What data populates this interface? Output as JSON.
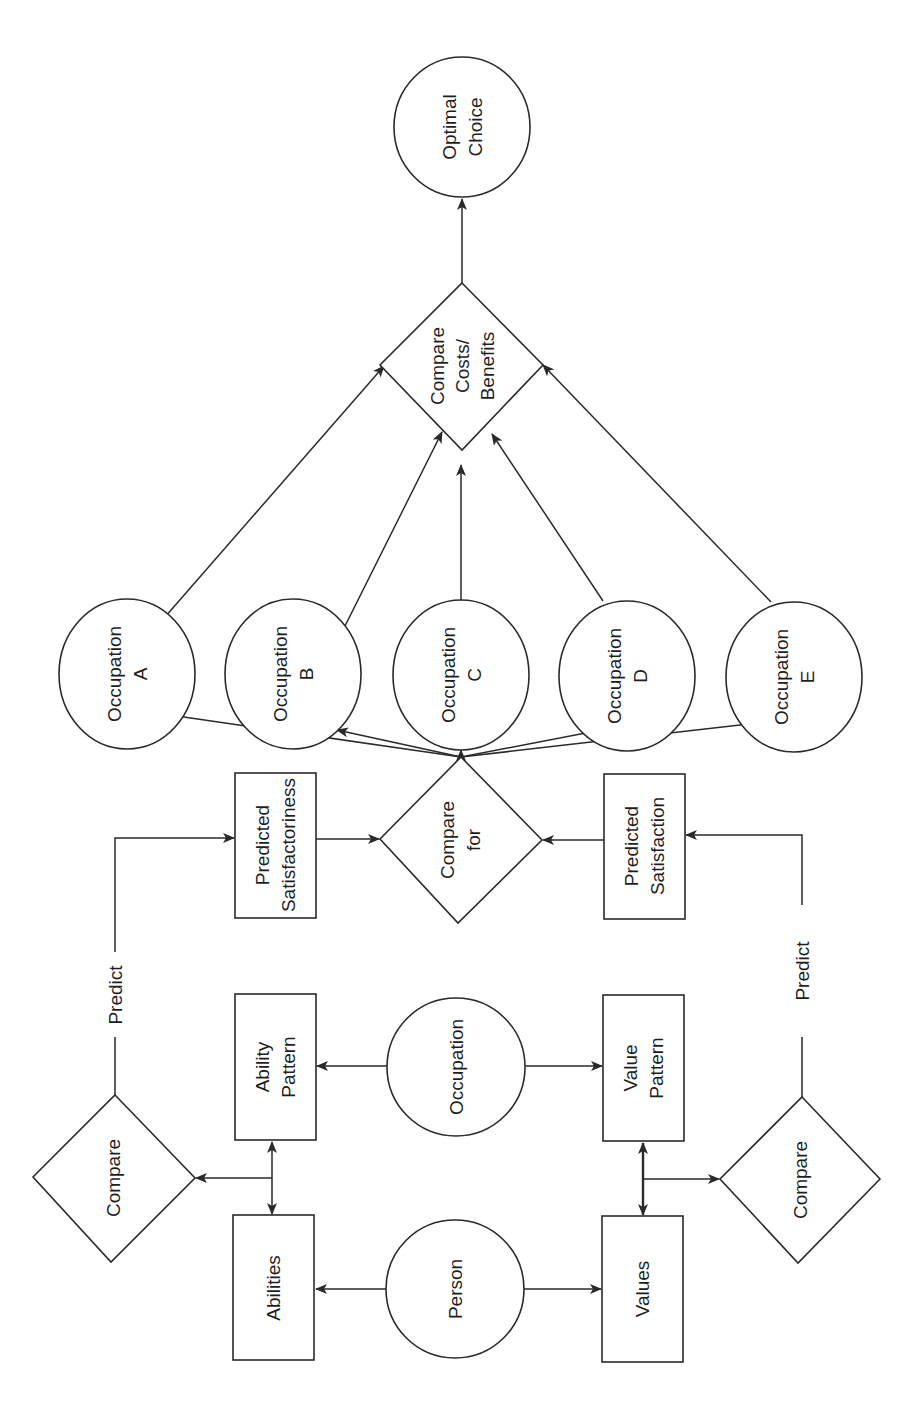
{
  "diagram": {
    "orientation": "rotated 90deg counter-clockwise (text reads bottom-to-top)",
    "nodes": {
      "person": {
        "label": "Person",
        "shape": "circle"
      },
      "occupation": {
        "label": "Occupation",
        "shape": "circle"
      },
      "abilities": {
        "label": "Abilities",
        "shape": "rect"
      },
      "ability_pattern": {
        "line1": "Ability",
        "line2": "Pattern",
        "shape": "rect"
      },
      "values": {
        "label": "Values",
        "shape": "rect"
      },
      "value_pattern": {
        "line1": "Value",
        "line2": "Pattern",
        "shape": "rect"
      },
      "compare_left": {
        "label": "Compare",
        "shape": "diamond"
      },
      "compare_right": {
        "label": "Compare",
        "shape": "diamond"
      },
      "predicted_satisfactoriness": {
        "line1": "Predicted",
        "line2": "Satisfactoriness",
        "shape": "rect"
      },
      "predicted_satisfaction": {
        "line1": "Predicted",
        "line2": "Satisfaction",
        "shape": "rect"
      },
      "compare_for": {
        "line1": "Compare",
        "line2": "for",
        "shape": "diamond"
      },
      "occupations": [
        {
          "line1": "Occupation",
          "line2": "A"
        },
        {
          "line1": "Occupation",
          "line2": "B"
        },
        {
          "line1": "Occupation",
          "line2": "C"
        },
        {
          "line1": "Occupation",
          "line2": "D"
        },
        {
          "line1": "Occupation",
          "line2": "E"
        }
      ],
      "compare_costs": {
        "line1": "Compare",
        "line2": "Costs/",
        "line3": "Benefits",
        "shape": "diamond"
      },
      "optimal_choice": {
        "line1": "Optimal",
        "line2": "Choice",
        "shape": "circle"
      }
    },
    "edge_labels": {
      "predict_left": "Predict",
      "predict_right": "Predict"
    },
    "edges": [
      [
        "Person",
        "Abilities"
      ],
      [
        "Person",
        "Values"
      ],
      [
        "Occupation",
        "Ability Pattern"
      ],
      [
        "Occupation",
        "Value Pattern"
      ],
      [
        "Abilities",
        "Ability Pattern",
        "bidirectional"
      ],
      [
        "Values",
        "Value Pattern",
        "bidirectional"
      ],
      [
        "Abilities/Ability Pattern",
        "Compare"
      ],
      [
        "Values/Value Pattern",
        "Compare"
      ],
      [
        "Compare",
        "Predicted Satisfactoriness",
        "Predict"
      ],
      [
        "Compare",
        "Predicted Satisfaction",
        "Predict"
      ],
      [
        "Predicted Satisfactoriness",
        "Compare for"
      ],
      [
        "Predicted Satisfaction",
        "Compare for"
      ],
      [
        "Compare for",
        "Occupation A"
      ],
      [
        "Compare for",
        "Occupation B"
      ],
      [
        "Compare for",
        "Occupation C"
      ],
      [
        "Compare for",
        "Occupation D"
      ],
      [
        "Compare for",
        "Occupation E"
      ],
      [
        "Occupation A",
        "Compare Costs/Benefits"
      ],
      [
        "Occupation B",
        "Compare Costs/Benefits"
      ],
      [
        "Occupation C",
        "Compare Costs/Benefits"
      ],
      [
        "Occupation D",
        "Compare Costs/Benefits"
      ],
      [
        "Occupation E",
        "Compare Costs/Benefits"
      ],
      [
        "Compare Costs/Benefits",
        "Optimal Choice"
      ]
    ],
    "colors": {
      "stroke": "#2a2a2a",
      "background": "#ffffff",
      "text": "#1e1e1e"
    }
  }
}
